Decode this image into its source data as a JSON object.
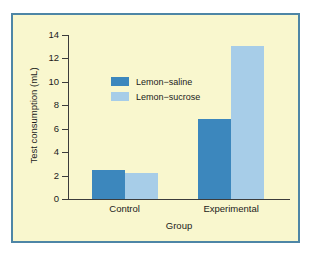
{
  "figure": {
    "background_color": "#f9f7ce",
    "border_color": "#4e86a6",
    "axis_color": "#3c3c3c"
  },
  "page_edge_fragments": [
    "",
    "",
    "",
    "",
    "",
    ""
  ],
  "chart_data": {
    "type": "bar",
    "title": "",
    "xlabel": "Group",
    "ylabel": "Test consumption (mL)",
    "categories": [
      "Control",
      "Experimental"
    ],
    "series": [
      {
        "name": "Lemon−saline",
        "color": "#3c87bd",
        "values": [
          2.45,
          6.8
        ]
      },
      {
        "name": "Lemon−sucrose",
        "color": "#a7cde8",
        "values": [
          2.2,
          13.05
        ]
      }
    ],
    "ylim": [
      0,
      14
    ],
    "yticks": [
      0,
      2,
      4,
      6,
      8,
      10,
      12,
      14
    ],
    "ytick_labels": [
      "0",
      "2",
      "4",
      "6",
      "8",
      "10",
      "12",
      "14"
    ],
    "grid": false,
    "legend_position": "upper-left-inside"
  }
}
